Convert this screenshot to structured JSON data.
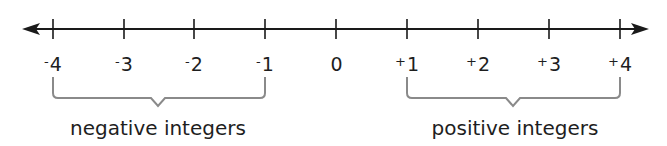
{
  "diagram": {
    "type": "number-line",
    "colors": {
      "line": "#1a1a1a",
      "bracket": "#8a8a8a",
      "text": "#1e1e1e"
    },
    "ticks": [
      {
        "sign": "-",
        "value": "4",
        "x": 53
      },
      {
        "sign": "-",
        "value": "3",
        "x": 124
      },
      {
        "sign": "-",
        "value": "2",
        "x": 194
      },
      {
        "sign": "-",
        "value": "1",
        "x": 265
      },
      {
        "sign": "",
        "value": "0",
        "x": 336
      },
      {
        "sign": "+",
        "value": "1",
        "x": 407
      },
      {
        "sign": "+",
        "value": "2",
        "x": 478
      },
      {
        "sign": "+",
        "value": "3",
        "x": 549
      },
      {
        "sign": "+",
        "value": "4",
        "x": 620
      }
    ],
    "groups": {
      "negative": {
        "label": "negative integers",
        "from": "-4",
        "to": "-1"
      },
      "positive": {
        "label": "positive integers",
        "from": "+1",
        "to": "+4"
      }
    }
  }
}
